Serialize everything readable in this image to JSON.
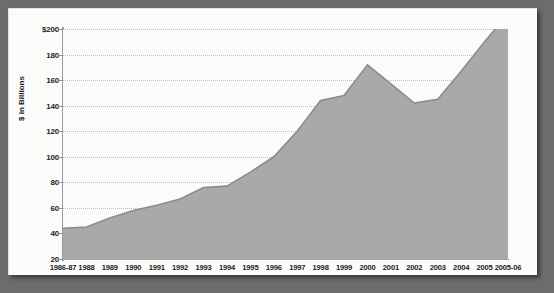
{
  "chart_data": {
    "type": "area",
    "title": "",
    "xlabel": "",
    "ylabel": "$ in Billions",
    "categories": [
      "1986-87",
      "1988",
      "1989",
      "1990",
      "1991",
      "1992",
      "1993",
      "1994",
      "1995",
      "1996",
      "1997",
      "1998",
      "1999",
      "2000",
      "2001",
      "2002",
      "2003",
      "2004",
      "2005",
      "2005-06"
    ],
    "values": [
      44,
      45,
      52,
      58,
      62,
      67,
      76,
      77,
      88,
      100,
      120,
      144,
      148,
      172,
      157,
      142,
      145,
      167,
      190,
      212
    ],
    "series": [
      {
        "name": "$ in Billions",
        "values": [
          44,
          45,
          52,
          58,
          62,
          67,
          76,
          77,
          88,
          100,
          120,
          144,
          148,
          172,
          157,
          142,
          145,
          167,
          190,
          212
        ]
      }
    ],
    "ylim": [
      20,
      200
    ],
    "yticks": [
      20,
      40,
      60,
      80,
      100,
      120,
      140,
      160,
      180,
      200
    ],
    "ytick_labels": [
      "20",
      "40",
      "60",
      "80",
      "100",
      "120",
      "140",
      "160",
      "180",
      "$200"
    ],
    "grid": true,
    "legend": "none",
    "colors": {
      "area_fill": "#a9a9a9",
      "area_line": "#8c8c8c",
      "gridline": "#bdbdbd",
      "axis": "#8f8f8f",
      "text": "#1d1d1d",
      "plot_background": "#fbfbfa",
      "card_background": "#fbfbfa",
      "page_background": "#6c6c6c"
    }
  }
}
